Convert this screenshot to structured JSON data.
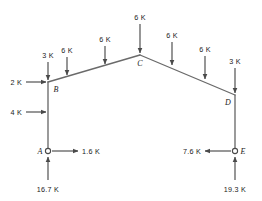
{
  "figure": {
    "type": "free-body-diagram",
    "units": "K",
    "stroke_color": "#4a4a4a",
    "text_color": "#1a1a1a",
    "background": "#ffffff"
  },
  "joints": [
    {
      "id": "A",
      "label": "A",
      "x": 48,
      "y": 151,
      "marker": "circle-pin"
    },
    {
      "id": "B",
      "label": "B",
      "x": 48,
      "y": 82,
      "marker": "none"
    },
    {
      "id": "C",
      "label": "C",
      "x": 140,
      "y": 55,
      "marker": "none"
    },
    {
      "id": "D",
      "label": "D",
      "x": 235,
      "y": 95,
      "marker": "none"
    },
    {
      "id": "E",
      "label": "E",
      "x": 235,
      "y": 151,
      "marker": "circle-pin"
    }
  ],
  "members": [
    {
      "name": "column-AB",
      "from": "A",
      "to": "B"
    },
    {
      "name": "rafter-BC",
      "from": "B",
      "to": "C"
    },
    {
      "name": "rafter-CD",
      "from": "C",
      "to": "D"
    },
    {
      "name": "column-DE",
      "from": "D",
      "to": "E"
    }
  ],
  "loads": [
    {
      "name": "load-b-vertical",
      "label": "3 K",
      "magnitude": 3,
      "direction": "down",
      "tip_x": 48,
      "tip_y": 80,
      "label_x": 48,
      "label_y": 58
    },
    {
      "name": "load-bc-1",
      "label": "6 K",
      "magnitude": 6,
      "direction": "down",
      "tip_x": 67,
      "tip_y": 75,
      "label_x": 67,
      "label_y": 53
    },
    {
      "name": "load-bc-2",
      "label": "6 K",
      "magnitude": 6,
      "direction": "down",
      "tip_x": 105,
      "tip_y": 64,
      "label_x": 105,
      "label_y": 42
    },
    {
      "name": "load-c-apex",
      "label": "6 K",
      "magnitude": 6,
      "direction": "down",
      "tip_x": 140,
      "tip_y": 53,
      "label_x": 140,
      "label_y": 20
    },
    {
      "name": "load-cd-1",
      "label": "6 K",
      "magnitude": 6,
      "direction": "down",
      "tip_x": 172,
      "tip_y": 65,
      "label_x": 172,
      "label_y": 38
    },
    {
      "name": "load-cd-2",
      "label": "6 K",
      "magnitude": 6,
      "direction": "down",
      "tip_x": 205,
      "tip_y": 79,
      "label_x": 205,
      "label_y": 52
    },
    {
      "name": "load-d-vertical",
      "label": "3 K",
      "magnitude": 3,
      "direction": "down",
      "tip_x": 235,
      "tip_y": 93,
      "label_x": 235,
      "label_y": 64
    },
    {
      "name": "load-b-lateral",
      "label": "2 K",
      "magnitude": 2,
      "direction": "right",
      "tip_x": 46,
      "tip_y": 82,
      "label_x": 14,
      "label_y": 85
    },
    {
      "name": "load-ab-lateral",
      "label": "4 K",
      "magnitude": 4,
      "direction": "right",
      "tip_x": 46,
      "tip_y": 112,
      "label_x": 14,
      "label_y": 115
    },
    {
      "name": "reaction-a-horiz",
      "label": "1.6 K",
      "magnitude": 1.6,
      "direction": "right",
      "tip_x": 78,
      "tip_y": 151,
      "label_x": 82,
      "label_y": 154
    },
    {
      "name": "reaction-a-vert",
      "label": "16.7 K",
      "magnitude": 16.7,
      "direction": "up",
      "tip_x": 48,
      "tip_y": 157,
      "label_x": 48,
      "label_y": 190
    },
    {
      "name": "reaction-e-horiz",
      "label": "7.6 K",
      "magnitude": 7.6,
      "direction": "left",
      "tip_x": 205,
      "tip_y": 151,
      "label_x": 201,
      "label_y": 154
    },
    {
      "name": "reaction-e-vert",
      "label": "19.3 K",
      "magnitude": 19.3,
      "direction": "up",
      "tip_x": 235,
      "tip_y": 157,
      "label_x": 235,
      "label_y": 190
    }
  ]
}
